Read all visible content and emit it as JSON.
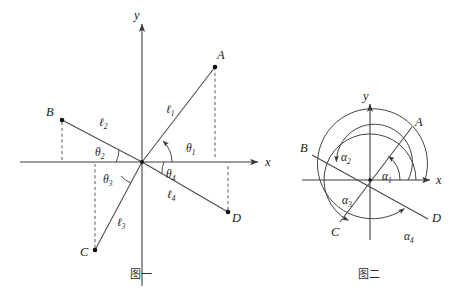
{
  "figure_left": {
    "caption": "图一",
    "axis_x_label": "x",
    "axis_y_label": "y",
    "points": [
      {
        "name": "A",
        "label": "A"
      },
      {
        "name": "B",
        "label": "B"
      },
      {
        "name": "C",
        "label": "C"
      },
      {
        "name": "D",
        "label": "D"
      }
    ],
    "segments": [
      {
        "name": "l1",
        "base": "ℓ",
        "sub": "1"
      },
      {
        "name": "l2",
        "base": "ℓ",
        "sub": "2"
      },
      {
        "name": "l3",
        "base": "ℓ",
        "sub": "3"
      },
      {
        "name": "l4",
        "base": "ℓ",
        "sub": "4"
      }
    ],
    "angles": [
      {
        "name": "theta1",
        "base": "θ",
        "sub": "1"
      },
      {
        "name": "theta2",
        "base": "θ",
        "sub": "2"
      },
      {
        "name": "theta3",
        "base": "θ",
        "sub": "3"
      },
      {
        "name": "theta4",
        "base": "θ",
        "sub": "4"
      }
    ]
  },
  "figure_right": {
    "caption": "图二",
    "axis_x_label": "x",
    "axis_y_label": "y",
    "points": [
      {
        "name": "A",
        "label": "A"
      },
      {
        "name": "B",
        "label": "B"
      },
      {
        "name": "C",
        "label": "C"
      },
      {
        "name": "D",
        "label": "D"
      }
    ],
    "angles": [
      {
        "name": "alpha1",
        "base": "α",
        "sub": "1"
      },
      {
        "name": "alpha2",
        "base": "α",
        "sub": "2"
      },
      {
        "name": "alpha3",
        "base": "α",
        "sub": "3"
      },
      {
        "name": "alpha4",
        "base": "α",
        "sub": "4"
      }
    ]
  },
  "colors": {
    "ink": "#1a1a1a",
    "line": "#3a3a3a",
    "background": "#ffffff"
  }
}
